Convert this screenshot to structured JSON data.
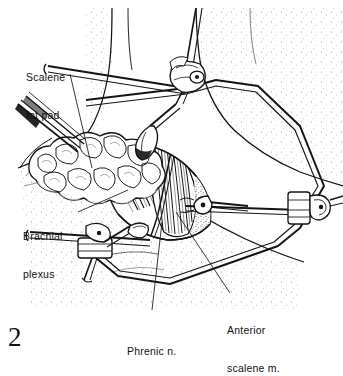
{
  "figure": {
    "number": "2",
    "caption_style": "serif-numeral",
    "background_color": "#ffffff",
    "ink_color": "#141414",
    "technique": "pen-and-ink line drawing with stipple shading"
  },
  "labels": [
    {
      "id": "scalene-fat-pad",
      "text_line_1": "Scalene",
      "text_line_2": "fat pad",
      "x": 26,
      "y": 46
    },
    {
      "id": "brachial-plexus",
      "text_line_1": "Brachial",
      "text_line_2": "plexus",
      "x": 23,
      "y": 205
    },
    {
      "id": "phrenic-nerve",
      "text_line_1": "Phrenic n.",
      "text_line_2": "",
      "x": 127,
      "y": 320
    },
    {
      "id": "anterior-scalene-muscle",
      "text_line_1": "Anterior",
      "text_line_2": "scalene m.",
      "x": 227,
      "y": 299
    }
  ],
  "anatomy": [
    {
      "id": "neck-column",
      "name": "neck"
    },
    {
      "id": "shoulder-chest",
      "name": "shoulder and chest wall"
    },
    {
      "id": "scalene-fat-pad-mass",
      "name": "scalene fat pad"
    },
    {
      "id": "brachial-plexus-trunks",
      "name": "brachial plexus trunks"
    },
    {
      "id": "anterior-scalene-muscle-belly",
      "name": "anterior scalene muscle"
    },
    {
      "id": "phrenic-nerve-cord",
      "name": "phrenic nerve"
    }
  ],
  "instruments": [
    {
      "id": "retractor-frame",
      "name": "self-retaining retractor frame"
    },
    {
      "id": "clamp-top",
      "name": "top clamp assembly"
    },
    {
      "id": "clamp-right",
      "name": "right clamp assembly"
    },
    {
      "id": "clamp-lower-left",
      "name": "lower left clamp assembly"
    },
    {
      "id": "retractor-blade-upper",
      "name": "upper retractor blade"
    },
    {
      "id": "retractor-blade-right",
      "name": "right retractor blade"
    },
    {
      "id": "retractor-blade-lower",
      "name": "lower retractor blade"
    },
    {
      "id": "forceps",
      "name": "forceps"
    }
  ]
}
